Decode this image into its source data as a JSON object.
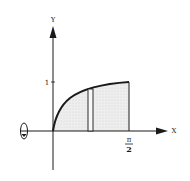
{
  "diagram": {
    "type": "solid-of-revolution",
    "curve": "increasing concave curve from origin to (pi/2, 1)",
    "axes": {
      "x_label": "X",
      "y_label": "Y"
    },
    "ticks": {
      "y_one": "1",
      "x_end_numerator": "π",
      "x_end_denominator": "2"
    },
    "rotation_axis": "x-axis",
    "colors": {
      "line": "#1a1a1a",
      "fill": "#e6e6e6"
    }
  }
}
